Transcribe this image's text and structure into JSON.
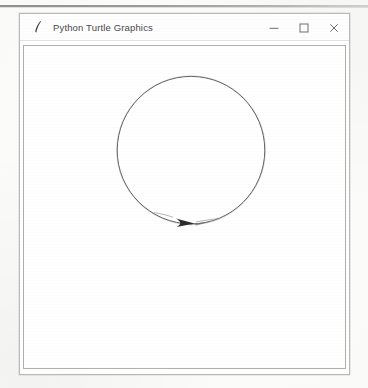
{
  "page": {
    "background_color": "#fdfdfc",
    "scan_artifact_color": "#8a8a8a"
  },
  "window": {
    "title": "Python Turtle Graphics",
    "icon_name": "python-turtle-feather-icon",
    "border_color": "#b9b9b7",
    "titlebar_color": "#fefefe",
    "title_text_color": "#49494a",
    "controls": [
      {
        "name": "minimize",
        "label": "–",
        "icon": "minimize-icon"
      },
      {
        "name": "maximize",
        "label": "☐",
        "icon": "maximize-icon"
      },
      {
        "name": "close",
        "label": "×",
        "icon": "close-icon"
      }
    ]
  },
  "canvas": {
    "background_color": "#ffffff",
    "border_color": "#aeaeac",
    "width": 323,
    "height": 324,
    "drawing": {
      "description": "circle traced by turtle with arrowhead cursor at bottom",
      "stroke_color": "#5a5a5a",
      "stroke_width": 1,
      "circle": {
        "center_x": 167,
        "center_y": 104,
        "radius": 74
      },
      "turtle_cursor": {
        "name": "turtle-arrow",
        "x": 167,
        "y": 178,
        "heading_degrees": 0,
        "fill_color": "#2b2b2b"
      }
    }
  }
}
